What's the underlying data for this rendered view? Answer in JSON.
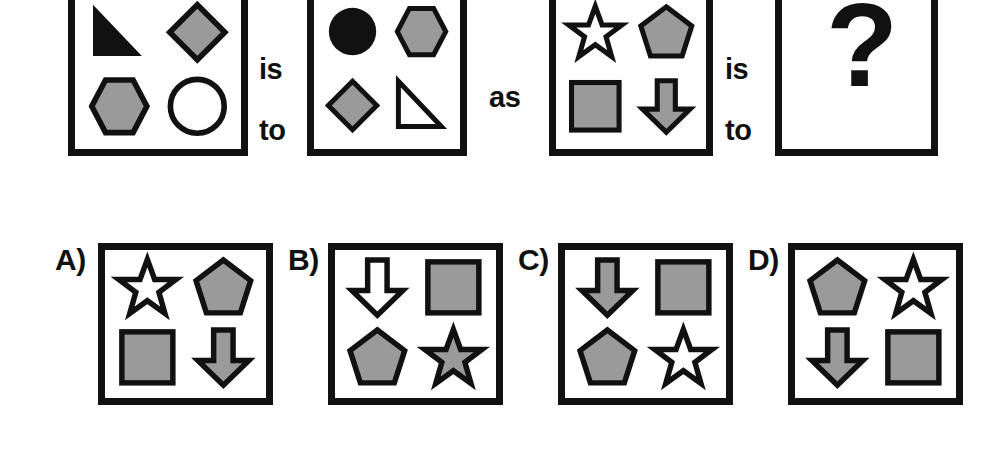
{
  "puzzle": {
    "type": "visual-analogy-multiple-choice",
    "colors": {
      "outline": "#111111",
      "gray_fill": "#9a9a9a",
      "white_fill": "#ffffff",
      "black_fill": "#111111",
      "background": "#ffffff"
    },
    "connectors": [
      {
        "id": "connector-1",
        "line1": "is",
        "line2": "to"
      },
      {
        "id": "connector-2",
        "line1": "as",
        "line2": ""
      },
      {
        "id": "connector-3",
        "line1": "is",
        "line2": "to"
      }
    ],
    "question_mark": "?",
    "prompt_panels": [
      {
        "id": "panel-1",
        "shapes": [
          {
            "position": "top-left",
            "shape": "triangle",
            "fill": "black"
          },
          {
            "position": "top-right",
            "shape": "diamond",
            "fill": "gray"
          },
          {
            "position": "bottom-left",
            "shape": "hexagon",
            "fill": "gray"
          },
          {
            "position": "bottom-right",
            "shape": "circle",
            "fill": "white"
          }
        ]
      },
      {
        "id": "panel-2",
        "shapes": [
          {
            "position": "top-left",
            "shape": "circle",
            "fill": "black"
          },
          {
            "position": "top-right",
            "shape": "hexagon",
            "fill": "gray"
          },
          {
            "position": "bottom-left",
            "shape": "diamond",
            "fill": "gray"
          },
          {
            "position": "bottom-right",
            "shape": "triangle",
            "fill": "white"
          }
        ]
      },
      {
        "id": "panel-3",
        "shapes": [
          {
            "position": "top-left",
            "shape": "star",
            "fill": "white"
          },
          {
            "position": "top-right",
            "shape": "pentagon",
            "fill": "gray"
          },
          {
            "position": "bottom-left",
            "shape": "square",
            "fill": "gray"
          },
          {
            "position": "bottom-right",
            "shape": "arrow",
            "fill": "gray"
          }
        ]
      },
      {
        "id": "panel-4",
        "shapes": [],
        "content": "question-mark"
      }
    ],
    "options": [
      {
        "id": "option-a",
        "label": "A)",
        "shapes": [
          {
            "position": "top-left",
            "shape": "star",
            "fill": "white"
          },
          {
            "position": "top-right",
            "shape": "pentagon",
            "fill": "gray"
          },
          {
            "position": "bottom-left",
            "shape": "square",
            "fill": "gray"
          },
          {
            "position": "bottom-right",
            "shape": "arrow",
            "fill": "gray"
          }
        ]
      },
      {
        "id": "option-b",
        "label": "B)",
        "shapes": [
          {
            "position": "top-left",
            "shape": "arrow",
            "fill": "white"
          },
          {
            "position": "top-right",
            "shape": "square",
            "fill": "gray"
          },
          {
            "position": "bottom-left",
            "shape": "pentagon",
            "fill": "gray"
          },
          {
            "position": "bottom-right",
            "shape": "star",
            "fill": "gray"
          }
        ]
      },
      {
        "id": "option-c",
        "label": "C)",
        "shapes": [
          {
            "position": "top-left",
            "shape": "arrow",
            "fill": "gray"
          },
          {
            "position": "top-right",
            "shape": "square",
            "fill": "gray"
          },
          {
            "position": "bottom-left",
            "shape": "pentagon",
            "fill": "gray"
          },
          {
            "position": "bottom-right",
            "shape": "star",
            "fill": "white"
          }
        ]
      },
      {
        "id": "option-d",
        "label": "D)",
        "shapes": [
          {
            "position": "top-left",
            "shape": "pentagon",
            "fill": "gray"
          },
          {
            "position": "top-right",
            "shape": "star",
            "fill": "white"
          },
          {
            "position": "bottom-left",
            "shape": "arrow",
            "fill": "gray"
          },
          {
            "position": "bottom-right",
            "shape": "square",
            "fill": "gray"
          }
        ]
      }
    ]
  }
}
